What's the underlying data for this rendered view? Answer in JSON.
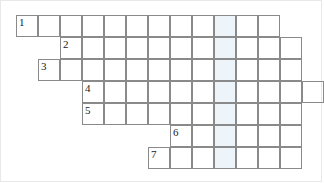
{
  "puzzle": {
    "type": "crossword-word-ladder",
    "title": "",
    "cell_size": 22,
    "origin_x": 15,
    "origin_y": 14,
    "grid_columns": 14,
    "grid_rows": 7,
    "border_color": "#8a8a8a",
    "background_color": "#ffffff",
    "highlight_color": "#eef5fa",
    "number_color": "#1a1a1a",
    "frame_border_color": "#e8e8e8",
    "highlight_column_index": 9,
    "rows": [
      {
        "number": "1",
        "row_index": 0,
        "start_column": 0,
        "length": 12,
        "letters": [
          "",
          "",
          "",
          "",
          "",
          "",
          "",
          "",
          "",
          "",
          "",
          ""
        ]
      },
      {
        "number": "2",
        "row_index": 1,
        "start_column": 2,
        "length": 11,
        "letters": [
          "",
          "",
          "",
          "",
          "",
          "",
          "",
          "",
          "",
          "",
          ""
        ]
      },
      {
        "number": "3",
        "row_index": 2,
        "start_column": 1,
        "length": 12,
        "letters": [
          "",
          "",
          "",
          "",
          "",
          "",
          "",
          "",
          "",
          "",
          "",
          ""
        ]
      },
      {
        "number": "4",
        "row_index": 3,
        "start_column": 3,
        "length": 11,
        "letters": [
          "",
          "",
          "",
          "",
          "",
          "",
          "",
          "",
          "",
          "",
          ""
        ]
      },
      {
        "number": "5",
        "row_index": 4,
        "start_column": 3,
        "length": 10,
        "letters": [
          "",
          "",
          "",
          "",
          "",
          "",
          "",
          "",
          "",
          ""
        ]
      },
      {
        "number": "6",
        "row_index": 5,
        "start_column": 7,
        "length": 6,
        "letters": [
          "",
          "",
          "",
          "",
          "",
          ""
        ]
      },
      {
        "number": "7",
        "row_index": 6,
        "start_column": 6,
        "length": 7,
        "letters": [
          "",
          "",
          "",
          "",
          "",
          "",
          ""
        ]
      }
    ]
  }
}
